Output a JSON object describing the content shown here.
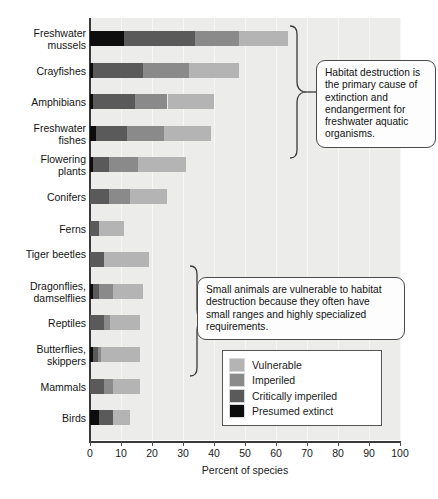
{
  "chart_data": {
    "type": "bar",
    "subtype": "stacked-horizontal",
    "title": "",
    "xlabel": "Percent of species",
    "ylabel": "",
    "xlim": [
      0,
      100
    ],
    "xticks": [
      0,
      10,
      20,
      30,
      40,
      50,
      60,
      70,
      80,
      90,
      100
    ],
    "grid": true,
    "legend_position": "inside-right",
    "categories": [
      "Freshwater mussels",
      "Crayfishes",
      "Amphibians",
      "Freshwater fishes",
      "Flowering plants",
      "Conifers",
      "Ferns",
      "Tiger beetles",
      "Dragonflies, damselflies",
      "Reptiles",
      "Butterflies, skippers",
      "Mammals",
      "Birds"
    ],
    "series": [
      {
        "name": "Presumed extinct",
        "color": "#0d0d0d",
        "values": [
          11,
          1,
          1,
          2,
          1,
          0,
          0,
          0,
          1,
          0,
          1,
          0,
          3
        ]
      },
      {
        "name": "Critically imperiled",
        "color": "#5a5a5a",
        "values": [
          23,
          16,
          13.5,
          10,
          5,
          6,
          3,
          4.5,
          2,
          4.5,
          1.5,
          4.5,
          4.5
        ]
      },
      {
        "name": "Imperiled",
        "color": "#8a8a8a",
        "values": [
          14,
          15,
          10.5,
          12,
          9.5,
          7,
          0,
          0,
          4.5,
          2,
          1,
          3,
          0
        ]
      },
      {
        "name": "Vulnerable",
        "color": "#b4b4b4",
        "values": [
          16,
          16,
          15,
          15,
          15.5,
          12,
          8,
          14.5,
          9.5,
          9.5,
          12.5,
          8.5,
          5.5
        ]
      }
    ],
    "totals": [
      64,
      48,
      40,
      39,
      31,
      25,
      11,
      19,
      17,
      16,
      16,
      16,
      13
    ]
  },
  "legend": {
    "items": [
      {
        "label": "Vulnerable",
        "color": "#b4b4b4"
      },
      {
        "label": "Imperiled",
        "color": "#8a8a8a"
      },
      {
        "label": "Critically imperiled",
        "color": "#5a5a5a"
      },
      {
        "label": "Presumed extinct",
        "color": "#0d0d0d"
      }
    ]
  },
  "callouts": {
    "habitat": "Habitat destruction is the primary cause of extinction and endangerment for freshwater aquatic organisms.",
    "small_animals": "Small animals are vulnerable to habitat destruction because they often have small ranges and highly specialized requirements."
  },
  "colors": {
    "plot_background": "#ececeb",
    "axis": "#3a3a3a",
    "gridline": "#f7f7f6",
    "callout_border": "#4a4a4a"
  }
}
